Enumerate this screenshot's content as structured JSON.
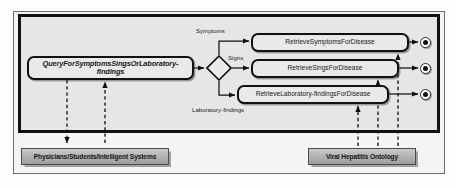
{
  "diagram": {
    "type": "uml-activity-diagram",
    "frame": {
      "outer_border_color": "#6d6d6d",
      "inner_border_color": "#111111",
      "lane_background": "#e6e6e4",
      "page_background": "#f4f4f2"
    },
    "nodes": {
      "query": {
        "label": "QueryForSymptomsSingsOrLaboratory-findings",
        "shape": "rounded-rectangle",
        "style": "italic-bold"
      },
      "retrieve_symptoms": {
        "label": "RetrieveSymptomsForDisease",
        "shape": "rounded-rectangle"
      },
      "retrieve_signs": {
        "label": "RetrieveSingsForDisease",
        "shape": "rounded-rectangle"
      },
      "retrieve_lab": {
        "label": "RetrieveLaboratory-findingsForDisease",
        "shape": "rounded-rectangle"
      },
      "decision": {
        "label": "",
        "shape": "diamond"
      }
    },
    "edge_labels": {
      "symptoms": "Symptoms",
      "signs": "Signs",
      "laboratory_findings": "Laboratory-findings"
    },
    "actors": {
      "left": {
        "label": "Physicians/Students/Intelligent Systems",
        "fill": "#b5b5b5"
      },
      "right": {
        "label": "Viral Hepatitis Ontology",
        "fill": "#b5b5b5"
      }
    },
    "end_states": {
      "count": 3,
      "label": "final-node"
    }
  }
}
